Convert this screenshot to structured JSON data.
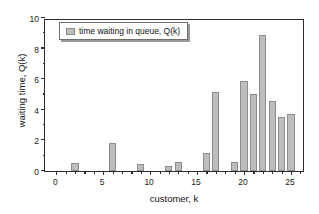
{
  "chart_data": {
    "type": "bar",
    "title": "",
    "xlabel": "customer, k",
    "ylabel": "waiting time, Q(k)",
    "xlim": [
      -1.2,
      26.5
    ],
    "ylim": [
      0,
      10
    ],
    "xticks": [
      0,
      5,
      10,
      15,
      20,
      25
    ],
    "yticks": [
      0,
      2,
      4,
      6,
      8,
      10
    ],
    "xminor_step": 1,
    "yminor_step": 1,
    "grid": false,
    "legend": {
      "position": "upper-left-inside",
      "entries": [
        {
          "label": "time waiting in queue, Q(k)",
          "color": "#bdbdbd",
          "edge_color": "#8d8d8d"
        }
      ]
    },
    "series": [
      {
        "name": "time waiting in queue, Q(k)",
        "color": "#bdbdbd",
        "edge_color": "#8d8d8d",
        "x": [
          1,
          2,
          3,
          4,
          5,
          6,
          7,
          8,
          9,
          10,
          11,
          12,
          13,
          14,
          15,
          16,
          17,
          18,
          19,
          20,
          21,
          22,
          23,
          24,
          25
        ],
        "values": [
          0,
          0.5,
          0,
          0,
          0,
          1.8,
          0,
          0,
          0.45,
          0,
          0,
          0.3,
          0.6,
          0,
          0,
          1.15,
          5.15,
          0,
          0.6,
          5.9,
          5.05,
          8.9,
          4.6,
          3.5,
          3.75
        ]
      }
    ]
  },
  "axes": {
    "y_tick_labels": [
      "0",
      "2",
      "4",
      "6",
      "8",
      "10"
    ],
    "x_tick_labels": [
      "0",
      "5",
      "10",
      "15",
      "20",
      "25"
    ]
  },
  "colors": {
    "bar_fill": "#bdbdbd",
    "bar_edge": "#8d8d8d",
    "frame": "#2b2b2b",
    "background": "#ffffff",
    "text": "#111111"
  }
}
